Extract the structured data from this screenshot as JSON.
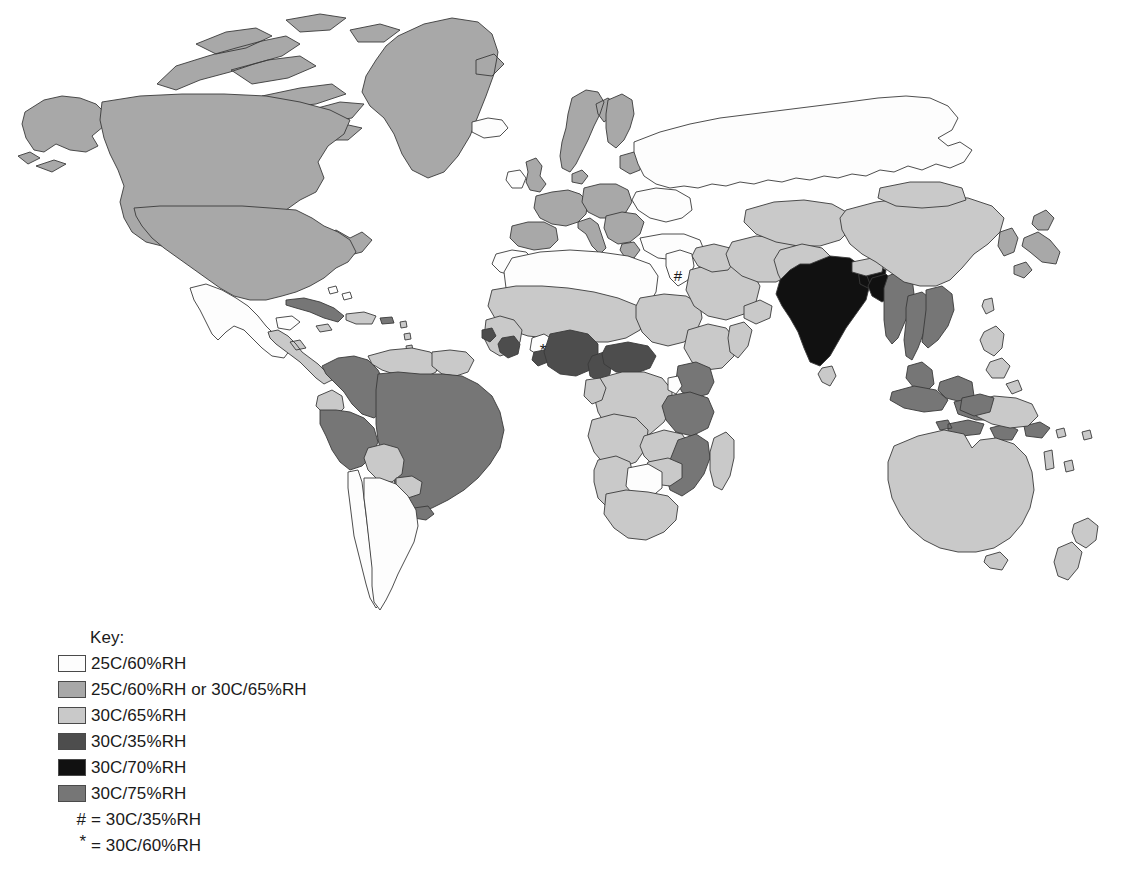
{
  "legend": {
    "title": "Key:",
    "entries": [
      {
        "label": "25C/60%RH",
        "color": "#fdfdfd",
        "id": "zone-25-60"
      },
      {
        "label": "25C/60%RH or 30C/65%RH",
        "color": "#a8a8a8",
        "id": "zone-25-60-or-30-65"
      },
      {
        "label": "30C/65%RH",
        "color": "#c9c9c9",
        "id": "zone-30-65"
      },
      {
        "label": "30C/35%RH",
        "color": "#4d4d4d",
        "id": "zone-30-35"
      },
      {
        "label": "30C/70%RH",
        "color": "#111111",
        "id": "zone-30-70"
      },
      {
        "label": "30C/75%RH",
        "color": "#767676",
        "id": "zone-30-75"
      }
    ],
    "notes": [
      {
        "symbol": "#",
        "equals": "=",
        "label": "30C/35%RH"
      },
      {
        "symbol": "*",
        "equals": "=",
        "label": "30C/60%RH"
      }
    ]
  },
  "map": {
    "ocean_color": "#ffffff",
    "border_color": "#3a3a3a",
    "markers": [
      {
        "symbol": "#",
        "x": 678,
        "y": 275,
        "region": "middle-east"
      },
      {
        "symbol": "*",
        "x": 543,
        "y": 351,
        "region": "west-africa"
      }
    ],
    "zone_colors": {
      "zone-25-60": "#fdfdfd",
      "zone-25-60-or-30-65": "#a8a8a8",
      "zone-30-65": "#c9c9c9",
      "zone-30-35": "#4d4d4d",
      "zone-30-70": "#111111",
      "zone-30-75": "#767676"
    },
    "regions": [
      {
        "name": "greenland",
        "zone": "zone-25-60-or-30-65"
      },
      {
        "name": "canada",
        "zone": "zone-25-60-or-30-65"
      },
      {
        "name": "alaska",
        "zone": "zone-25-60-or-30-65"
      },
      {
        "name": "canadian-arctic-islands",
        "zone": "zone-25-60-or-30-65"
      },
      {
        "name": "united-states",
        "zone": "zone-25-60-or-30-65"
      },
      {
        "name": "mexico",
        "zone": "zone-25-60"
      },
      {
        "name": "central-america",
        "zone": "zone-30-65"
      },
      {
        "name": "cuba",
        "zone": "zone-30-75"
      },
      {
        "name": "caribbean-islands",
        "zone": "zone-30-65"
      },
      {
        "name": "colombia",
        "zone": "zone-30-75"
      },
      {
        "name": "venezuela",
        "zone": "zone-30-65"
      },
      {
        "name": "guyanas",
        "zone": "zone-30-65"
      },
      {
        "name": "ecuador",
        "zone": "zone-30-65"
      },
      {
        "name": "peru",
        "zone": "zone-30-75"
      },
      {
        "name": "brazil",
        "zone": "zone-30-75"
      },
      {
        "name": "bolivia",
        "zone": "zone-30-65"
      },
      {
        "name": "paraguay",
        "zone": "zone-30-65"
      },
      {
        "name": "uruguay",
        "zone": "zone-30-75"
      },
      {
        "name": "argentina",
        "zone": "zone-25-60"
      },
      {
        "name": "chile",
        "zone": "zone-25-60"
      },
      {
        "name": "iceland",
        "zone": "zone-25-60"
      },
      {
        "name": "united-kingdom",
        "zone": "zone-25-60-or-30-65"
      },
      {
        "name": "ireland",
        "zone": "zone-25-60"
      },
      {
        "name": "norway-sweden",
        "zone": "zone-25-60-or-30-65"
      },
      {
        "name": "finland",
        "zone": "zone-25-60-or-30-65"
      },
      {
        "name": "western-europe",
        "zone": "zone-25-60-or-30-65"
      },
      {
        "name": "central-europe",
        "zone": "zone-25-60-or-30-65"
      },
      {
        "name": "iberia",
        "zone": "zone-25-60-or-30-65"
      },
      {
        "name": "italy",
        "zone": "zone-25-60-or-30-65"
      },
      {
        "name": "balkans",
        "zone": "zone-25-60-or-30-65"
      },
      {
        "name": "russia",
        "zone": "zone-25-60"
      },
      {
        "name": "ukraine",
        "zone": "zone-25-60"
      },
      {
        "name": "turkey",
        "zone": "zone-25-60"
      },
      {
        "name": "north-africa",
        "zone": "zone-25-60"
      },
      {
        "name": "morocco",
        "zone": "zone-25-60"
      },
      {
        "name": "sahel",
        "zone": "zone-30-65"
      },
      {
        "name": "west-africa-coast",
        "zone": "zone-30-65"
      },
      {
        "name": "nigeria",
        "zone": "zone-30-35"
      },
      {
        "name": "ghana",
        "zone": "zone-30-35"
      },
      {
        "name": "cote-divoire",
        "zone": "zone-30-35"
      },
      {
        "name": "central-african-rep",
        "zone": "zone-30-35"
      },
      {
        "name": "sudan",
        "zone": "zone-30-65"
      },
      {
        "name": "ethiopia",
        "zone": "zone-30-65"
      },
      {
        "name": "kenya",
        "zone": "zone-30-75"
      },
      {
        "name": "tanzania",
        "zone": "zone-30-75"
      },
      {
        "name": "mozambique",
        "zone": "zone-30-75"
      },
      {
        "name": "zimbabwe",
        "zone": "zone-30-65"
      },
      {
        "name": "botswana",
        "zone": "zone-25-60"
      },
      {
        "name": "south-africa",
        "zone": "zone-30-65"
      },
      {
        "name": "madagascar",
        "zone": "zone-30-65"
      },
      {
        "name": "congo-basin",
        "zone": "zone-30-65"
      },
      {
        "name": "angola",
        "zone": "zone-30-65"
      },
      {
        "name": "saudi-arabia",
        "zone": "zone-30-65"
      },
      {
        "name": "iran",
        "zone": "zone-30-65"
      },
      {
        "name": "iraq",
        "zone": "zone-30-65"
      },
      {
        "name": "israel-jordan",
        "zone": "zone-25-60"
      },
      {
        "name": "central-asia",
        "zone": "zone-30-65"
      },
      {
        "name": "afghanistan-pakistan",
        "zone": "zone-30-65"
      },
      {
        "name": "india",
        "zone": "zone-30-70"
      },
      {
        "name": "sri-lanka",
        "zone": "zone-30-65"
      },
      {
        "name": "bangladesh",
        "zone": "zone-30-70"
      },
      {
        "name": "myanmar",
        "zone": "zone-30-75"
      },
      {
        "name": "thailand",
        "zone": "zone-30-75"
      },
      {
        "name": "vietnam",
        "zone": "zone-30-75"
      },
      {
        "name": "malaysia",
        "zone": "zone-30-75"
      },
      {
        "name": "indonesia",
        "zone": "zone-30-75"
      },
      {
        "name": "philippines",
        "zone": "zone-30-65"
      },
      {
        "name": "china",
        "zone": "zone-30-65"
      },
      {
        "name": "mongolia",
        "zone": "zone-30-65"
      },
      {
        "name": "japan",
        "zone": "zone-25-60-or-30-65"
      },
      {
        "name": "korea",
        "zone": "zone-25-60-or-30-65"
      },
      {
        "name": "papua-new-guinea",
        "zone": "zone-30-65"
      },
      {
        "name": "australia",
        "zone": "zone-30-65"
      },
      {
        "name": "new-zealand",
        "zone": "zone-30-65"
      }
    ]
  }
}
